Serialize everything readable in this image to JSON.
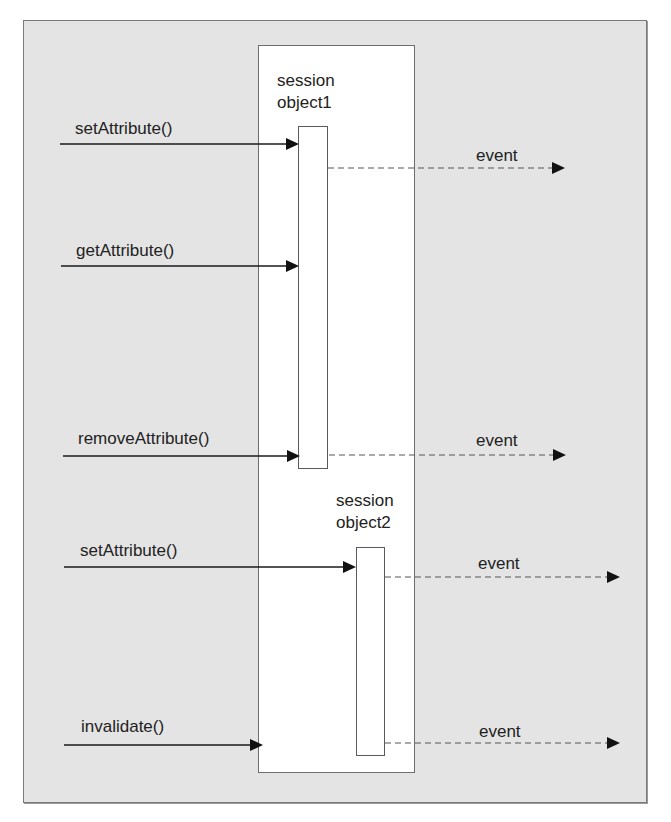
{
  "diagram": {
    "type": "sequence",
    "colors": {
      "background": "#e4e4e4",
      "session_box": "#ffffff",
      "line": "#1a1a1a",
      "dashed_line": "#555555"
    },
    "lifelines": [
      {
        "id": "object1",
        "label_line1": "session",
        "label_line2": "object1"
      },
      {
        "id": "object2",
        "label_line1": "session",
        "label_line2": "object2"
      }
    ],
    "calls": [
      {
        "label": "setAttribute()",
        "target": "object1"
      },
      {
        "label": "getAttribute()",
        "target": "object1"
      },
      {
        "label": "removeAttribute()",
        "target": "object1"
      },
      {
        "label": "setAttribute()",
        "target": "object2"
      },
      {
        "label": "invalidate()",
        "target": "session"
      }
    ],
    "events": [
      {
        "label": "event",
        "source": "object1"
      },
      {
        "label": "event",
        "source": "object1"
      },
      {
        "label": "event",
        "source": "object2"
      },
      {
        "label": "event",
        "source": "object2"
      }
    ]
  }
}
